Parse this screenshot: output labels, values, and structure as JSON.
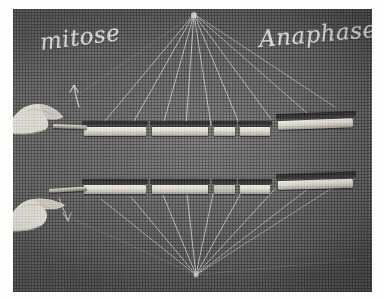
{
  "plate": {
    "caption_labels": {
      "left": "mitose",
      "right": "Anaphase"
    },
    "background_color": "#6b6b6b",
    "chalk_color": "#ececea",
    "chromosome_color": "#e8e5dd",
    "shadow_color": "#2c2c2c"
  },
  "poles": {
    "top": {
      "x": 181,
      "y": 4,
      "label": "top-spindle-pole"
    },
    "bottom": {
      "x": 183,
      "y": 266,
      "label": "bottom-spindle-pole"
    }
  },
  "upper_row": {
    "name": "upper-chromosome-plate",
    "segments": [
      {
        "x": 71,
        "y": 118,
        "w": 62,
        "h": 9
      },
      {
        "x": 139,
        "y": 118,
        "w": 56,
        "h": 9
      },
      {
        "x": 201,
        "y": 118,
        "w": 21,
        "h": 9
      },
      {
        "x": 227,
        "y": 118,
        "w": 30,
        "h": 9
      },
      {
        "x": 265,
        "y": 112,
        "w": 75,
        "h": 9
      }
    ]
  },
  "lower_row": {
    "name": "lower-chromosome-plate",
    "segments": [
      {
        "x": 71,
        "y": 176,
        "w": 62,
        "h": 9
      },
      {
        "x": 139,
        "y": 176,
        "w": 56,
        "h": 9
      },
      {
        "x": 201,
        "y": 176,
        "w": 21,
        "h": 9
      },
      {
        "x": 227,
        "y": 176,
        "w": 30,
        "h": 9
      },
      {
        "x": 265,
        "y": 172,
        "w": 75,
        "h": 9
      }
    ]
  },
  "hands": [
    {
      "name": "upper-left-hand",
      "x": 0,
      "y": 80,
      "w": 62,
      "h": 42
    },
    {
      "name": "lower-left-hand",
      "x": 0,
      "y": 172,
      "w": 62,
      "h": 50
    }
  ],
  "arrows": [
    {
      "name": "upper-chalk-arrow",
      "x": 52,
      "y": 78
    },
    {
      "name": "lower-chalk-arrow",
      "x": 42,
      "y": 190
    }
  ]
}
